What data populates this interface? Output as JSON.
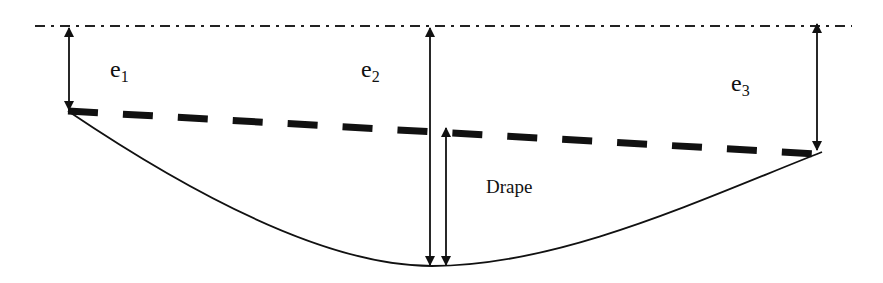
{
  "diagram": {
    "type": "cable drape / eccentricity diagram",
    "labels": {
      "e1": {
        "base": "e",
        "sub": "1"
      },
      "e2": {
        "base": "e",
        "sub": "2"
      },
      "e3": {
        "base": "e",
        "sub": "3"
      },
      "drape": "Drape"
    },
    "elements": {
      "reference_line": "dash-dot horizontal line (centroid axis)",
      "chord_line": "thick dashed line connecting end points",
      "cable_profile": "solid curve sagging to a low point at midspan",
      "dimension_arrows": [
        "e1",
        "e2",
        "e3",
        "Drape"
      ]
    },
    "colors": {
      "stroke": "#111111",
      "background": "#ffffff"
    }
  }
}
